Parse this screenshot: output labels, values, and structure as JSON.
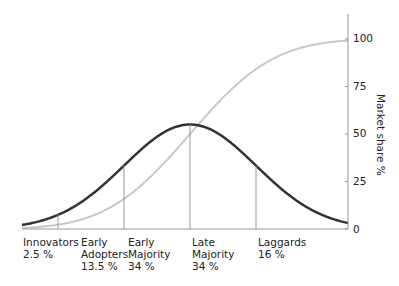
{
  "chart_data": {
    "type": "line",
    "title": "",
    "xlabel": "",
    "ylabel": "Market share %",
    "ylim": [
      0,
      100
    ],
    "yticks": [
      0,
      25,
      50,
      75,
      100
    ],
    "y_axis_position": "right",
    "grid": false,
    "legend": null,
    "series": [
      {
        "name": "Adoption (bell curve)",
        "kind": "normal-distribution",
        "color": "#333333",
        "peak_x_fraction": 0.5,
        "peak_value": 55
      },
      {
        "name": "Cumulative market share (S-curve)",
        "kind": "cumulative",
        "color": "#c8c8c8",
        "range": [
          0,
          100
        ]
      }
    ],
    "segments": [
      {
        "name": "Innovators",
        "share": "2.5 %"
      },
      {
        "name": "Early Adopters",
        "share": "13.5 %"
      },
      {
        "name": "Early Majority",
        "share": "34 %"
      },
      {
        "name": "Late Majority",
        "share": "34 %"
      },
      {
        "name": "Laggards",
        "share": "16 %"
      }
    ],
    "dividers_sigma": [
      -2,
      -1,
      0,
      1
    ]
  },
  "labels": {
    "innovators": {
      "l1": "Innovators",
      "l2": "2.5 %"
    },
    "early_adopters": {
      "l1": "Early",
      "l2": "Adopters",
      "l3": "13.5 %"
    },
    "early_majority": {
      "l1": "Early",
      "l2": "Majority",
      "l3": "34 %"
    },
    "late_majority": {
      "l1": "Late",
      "l2": "Majority",
      "l3": "34 %"
    },
    "laggards": {
      "l1": "Laggards",
      "l2": "16 %"
    }
  },
  "axis": {
    "ylabel": "Market share %",
    "ticks": [
      "0",
      "25",
      "50",
      "75",
      "100"
    ]
  }
}
